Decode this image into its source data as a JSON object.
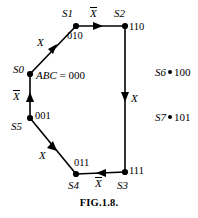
{
  "figure": {
    "caption": "FIG.1.8.",
    "assignment_label": {
      "vars": "ABC",
      "equals": " = ",
      "value": "000"
    },
    "nodes": [
      {
        "id": "S0",
        "label": "S0",
        "code": "",
        "x": 30,
        "y": 74,
        "label_x": 13,
        "label_y": 65,
        "code_x": 0,
        "code_y": 0
      },
      {
        "id": "S1",
        "label": "S1",
        "code": "010",
        "x": 76,
        "y": 26,
        "label_x": 62,
        "label_y": 9,
        "code_x": 67,
        "code_y": 30
      },
      {
        "id": "S2",
        "label": "S2",
        "code": "110",
        "x": 125,
        "y": 26,
        "label_x": 114,
        "label_y": 9,
        "code_x": 129,
        "code_y": 21
      },
      {
        "id": "S3",
        "label": "S3",
        "code": "111",
        "x": 125,
        "y": 172,
        "label_x": 117,
        "label_y": 181,
        "code_x": 129,
        "code_y": 166
      },
      {
        "id": "S4",
        "label": "S4",
        "code": "011",
        "x": 76,
        "y": 174,
        "label_x": 68,
        "label_y": 181,
        "code_x": 74,
        "code_y": 157
      },
      {
        "id": "S5",
        "label": "S5",
        "code": "001",
        "x": 30,
        "y": 118,
        "label_x": 12,
        "label_y": 122,
        "code_x": 35,
        "code_y": 111
      }
    ],
    "edges": [
      {
        "from": "S0",
        "to": "S1",
        "input": "X",
        "inverted": false,
        "label_x": 37,
        "label_y": 38
      },
      {
        "from": "S1",
        "to": "S2",
        "input": "X",
        "inverted": true,
        "label_x": 90,
        "label_y": 8
      },
      {
        "from": "S2",
        "to": "S3",
        "input": "X",
        "inverted": false,
        "label_x": 131,
        "label_y": 94
      },
      {
        "from": "S3",
        "to": "S4",
        "input": "X",
        "inverted": true,
        "label_x": 95,
        "label_y": 177
      },
      {
        "from": "S5",
        "to": "S4",
        "input": "X",
        "inverted": false,
        "label_x": 39,
        "label_y": 151
      },
      {
        "from": "S5",
        "to": "S0",
        "input": "X",
        "inverted": true,
        "label_x": 13,
        "label_y": 91
      }
    ],
    "unused_states": [
      {
        "label": "S6",
        "code": "100",
        "x": 155,
        "y": 67
      },
      {
        "label": "S7",
        "code": "101",
        "x": 155,
        "y": 112
      }
    ]
  }
}
